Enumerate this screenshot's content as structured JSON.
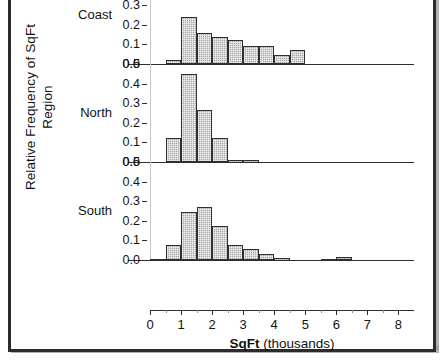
{
  "axes": {
    "ylabel_line1": "Relative Frequency of SqFt",
    "ylabel_line2": "Region",
    "xlabel_bold": "SqFt",
    "xlabel_rest": " (thousands)",
    "xticks": [
      "0",
      "1",
      "2",
      "3",
      "4",
      "5",
      "6",
      "7",
      "8"
    ],
    "yticks_visible": [
      "0.5",
      "0.4",
      "0.3",
      "0.2",
      "0.1",
      "0.0"
    ],
    "ytick_overlap_label": "0.0",
    "ytick_overlap_label2": "0.5"
  },
  "panel_labels": {
    "coast": "Coast",
    "north": "North",
    "south": "South"
  },
  "colors": {
    "bar_fill": "#a8a8a8",
    "bar_border": "#2f2f2f",
    "frame": "#2b2b2b",
    "text": "#111111"
  },
  "chart_data": {
    "type": "bar",
    "title": "",
    "subtitle": "",
    "xlabel": "SqFt (thousands)",
    "ylabel": "Relative Frequency of SqFt Region",
    "xlim": [
      0,
      8.5
    ],
    "ylim": [
      0,
      0.5
    ],
    "bin_width": 0.5,
    "grid": false,
    "legend": "none",
    "panel_layout": "vertical stacked panels, one per Region",
    "note": "Topmost panel is cropped by the image edge; its region label is not visible.",
    "panels": [
      {
        "name": "cropped-top",
        "label": "",
        "cropped": true,
        "bins": [
          {
            "x0": 0.5,
            "x1": 1.0,
            "value": 0.13
          },
          {
            "x0": 1.0,
            "x1": 1.5,
            "value": 0.13
          },
          {
            "x0": 1.5,
            "x1": 2.0,
            "value": 0.13
          },
          {
            "x0": 2.0,
            "x1": 2.5,
            "value": 0.13
          },
          {
            "x0": 2.5,
            "x1": 3.0,
            "value": 0.13
          },
          {
            "x0": 3.0,
            "x1": 3.5,
            "value": 0.04
          },
          {
            "x0": 3.5,
            "x1": 4.0,
            "value": 0.03
          },
          {
            "x0": 4.0,
            "x1": 4.5,
            "value": 0.01
          },
          {
            "x0": 4.5,
            "x1": 5.0,
            "value": 0.03
          }
        ]
      },
      {
        "name": "coast",
        "label": "Coast",
        "cropped": false,
        "bins": [
          {
            "x0": 0.5,
            "x1": 1.0,
            "value": 0.02
          },
          {
            "x0": 1.0,
            "x1": 1.5,
            "value": 0.24
          },
          {
            "x0": 1.5,
            "x1": 2.0,
            "value": 0.16
          },
          {
            "x0": 2.0,
            "x1": 2.5,
            "value": 0.14
          },
          {
            "x0": 2.5,
            "x1": 3.0,
            "value": 0.12
          },
          {
            "x0": 3.0,
            "x1": 3.5,
            "value": 0.09
          },
          {
            "x0": 3.5,
            "x1": 4.0,
            "value": 0.09
          },
          {
            "x0": 4.0,
            "x1": 4.5,
            "value": 0.045
          },
          {
            "x0": 4.5,
            "x1": 5.0,
            "value": 0.07
          }
        ]
      },
      {
        "name": "north",
        "label": "North",
        "cropped": false,
        "bins": [
          {
            "x0": 0.5,
            "x1": 1.0,
            "value": 0.12
          },
          {
            "x0": 1.0,
            "x1": 1.5,
            "value": 0.45
          },
          {
            "x0": 1.5,
            "x1": 2.0,
            "value": 0.265
          },
          {
            "x0": 2.0,
            "x1": 2.5,
            "value": 0.125
          },
          {
            "x0": 2.5,
            "x1": 3.0,
            "value": 0.01
          },
          {
            "x0": 3.0,
            "x1": 3.5,
            "value": 0.01
          }
        ]
      },
      {
        "name": "south",
        "label": "South",
        "cropped": false,
        "bins": [
          {
            "x0": 0.0,
            "x1": 0.5,
            "value": 0.005
          },
          {
            "x0": 0.5,
            "x1": 1.0,
            "value": 0.075
          },
          {
            "x0": 1.0,
            "x1": 1.5,
            "value": 0.245
          },
          {
            "x0": 1.5,
            "x1": 2.0,
            "value": 0.272
          },
          {
            "x0": 2.0,
            "x1": 2.5,
            "value": 0.175
          },
          {
            "x0": 2.5,
            "x1": 3.0,
            "value": 0.075
          },
          {
            "x0": 3.0,
            "x1": 3.5,
            "value": 0.055
          },
          {
            "x0": 3.5,
            "x1": 4.0,
            "value": 0.032
          },
          {
            "x0": 4.0,
            "x1": 4.5,
            "value": 0.01
          },
          {
            "x0": 5.5,
            "x1": 6.0,
            "value": 0.006
          },
          {
            "x0": 6.0,
            "x1": 6.5,
            "value": 0.016
          }
        ]
      }
    ]
  }
}
